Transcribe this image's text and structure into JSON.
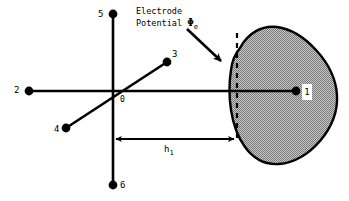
{
  "figure": {
    "annotation": {
      "line1": "Electrode",
      "line2_prefix": "Potential ",
      "symbol": "Φ",
      "symbol_subscript": "e"
    },
    "dimension": {
      "label_base": "h",
      "label_subscript": "1"
    },
    "nodes": [
      {
        "id": "0",
        "label": "0"
      },
      {
        "id": "1",
        "label": "1"
      },
      {
        "id": "2",
        "label": "2"
      },
      {
        "id": "3",
        "label": "3"
      },
      {
        "id": "4",
        "label": "4"
      },
      {
        "id": "5",
        "label": "5"
      },
      {
        "id": "6",
        "label": "6"
      }
    ],
    "colors": {
      "line": "#000000",
      "blob_fill": "#a8a8a8",
      "blob_outline": "#000000",
      "background": "#ffffff"
    }
  }
}
